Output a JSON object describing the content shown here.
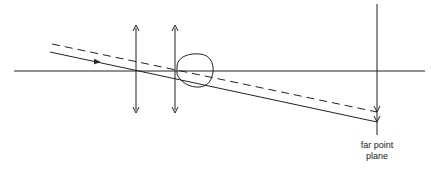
{
  "diagram": {
    "labels": {
      "far_point_plane_line1": "far point",
      "far_point_plane_line2": "plane"
    },
    "elements": [
      "optical axis",
      "lens 1 (converging)",
      "lens 2 (converging)",
      "eye",
      "solid ray",
      "dashed ray",
      "far point plane"
    ],
    "colors": {
      "stroke": "#222222",
      "background": "#ffffff"
    }
  }
}
